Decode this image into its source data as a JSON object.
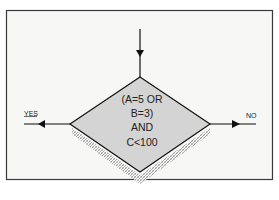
{
  "top_fragment": "nd the  paging  g",
  "flowchart": {
    "decision_lines": [
      "(A=5 OR",
      "B=3)",
      "AND",
      "C<100"
    ],
    "yes_label": "YES",
    "no_label": "NO"
  },
  "colors": {
    "frame": "#3a3a3a",
    "panel_bg": "#f7f7f5",
    "diamond_fill": "#d4d4d4",
    "shadow": "#9a9a9a",
    "line": "#111111"
  }
}
